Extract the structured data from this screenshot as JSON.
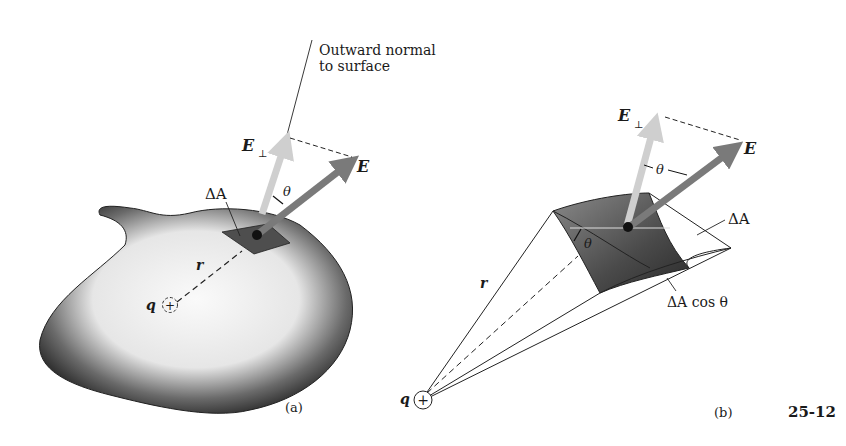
{
  "figure_number": "25-12",
  "panel_a": {
    "caption": "(a)",
    "normal_label_line1": "Outward normal",
    "normal_label_line2": "to surface",
    "e_perp_label": "E",
    "e_perp_sub": "⊥",
    "e_label": "E",
    "theta_label": "θ",
    "delta_a_label": "ΔA",
    "r_label": "r",
    "q_label": "q",
    "charge_sign": "+"
  },
  "panel_b": {
    "caption": "(b)",
    "e_perp_label": "E",
    "e_perp_sub": "⊥",
    "e_label": "E",
    "theta_top_label": "θ",
    "theta_patch_label": "θ",
    "delta_a_label": "ΔA",
    "delta_a_cos_label": "ΔA cos θ",
    "r_label": "r",
    "q_label": "q",
    "charge_sign": "+"
  },
  "colors": {
    "e_arrow": "#7a7a7a",
    "e_perp_arrow": "#c8c8c8",
    "patch": "#5a5a5a",
    "surface_dark": "#1e1e1e",
    "surface_light": "#f4f4f4",
    "line": "#1a1a1a"
  }
}
